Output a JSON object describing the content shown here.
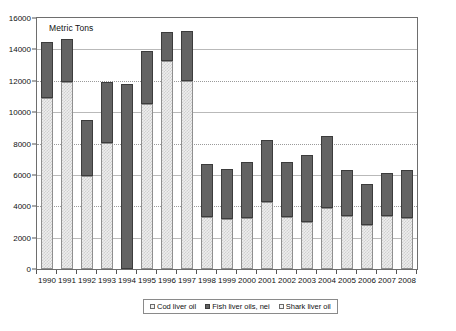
{
  "chart_data": {
    "type": "bar",
    "title": "",
    "subtitle": "",
    "axis_note": "Metric Tons",
    "xlabel": "",
    "ylabel": "Metric Tons",
    "ylim": [
      0,
      16000
    ],
    "ytick_step": 2000,
    "grid": true,
    "stacked": true,
    "legend_position": "bottom",
    "categories": [
      "1990",
      "1991",
      "1992",
      "1993",
      "1994",
      "1995",
      "1996",
      "1997",
      "1998",
      "1999",
      "2000",
      "2001",
      "2002",
      "2003",
      "2004",
      "2005",
      "2006",
      "2007",
      "2008"
    ],
    "yticks": [
      "0",
      "2000",
      "4000",
      "6000",
      "8000",
      "10000",
      "12000",
      "14000",
      "16000"
    ],
    "series": [
      {
        "name": "Cod liver oil",
        "color": "#eeeeee",
        "pattern": "light-checker",
        "values": [
          10900,
          11900,
          5900,
          8050,
          0,
          10550,
          13250,
          12000,
          3300,
          3200,
          3250,
          4250,
          3300,
          3000,
          3900,
          3400,
          2800,
          3350,
          3250
        ]
      },
      {
        "name": "Fish liver oils, nei",
        "color": "#636363",
        "pattern": "solid-dark",
        "values": [
          3600,
          2750,
          3600,
          3900,
          11800,
          3350,
          1850,
          3150,
          3400,
          3150,
          3600,
          4000,
          3500,
          4250,
          4550,
          2900,
          2650,
          2750,
          3050
        ]
      },
      {
        "name": "Shark liver oil",
        "color": "#f4f4f4",
        "pattern": "fine-grid",
        "values": [
          0,
          0,
          0,
          0,
          0,
          0,
          0,
          0,
          0,
          0,
          0,
          0,
          0,
          0,
          0,
          0,
          0,
          0,
          0
        ]
      }
    ],
    "totals": [
      14500,
      14650,
      9500,
      11950,
      11800,
      13900,
      15100,
      15150,
      6700,
      6350,
      6850,
      8250,
      6800,
      7250,
      8450,
      6300,
      5450,
      6100,
      6300
    ]
  },
  "legend": {
    "items": [
      {
        "label": "Cod liver oil",
        "swatch": "cod"
      },
      {
        "label": "Fish liver oils, nei",
        "swatch": "fish"
      },
      {
        "label": "Shark liver oil",
        "swatch": "shark"
      }
    ]
  }
}
